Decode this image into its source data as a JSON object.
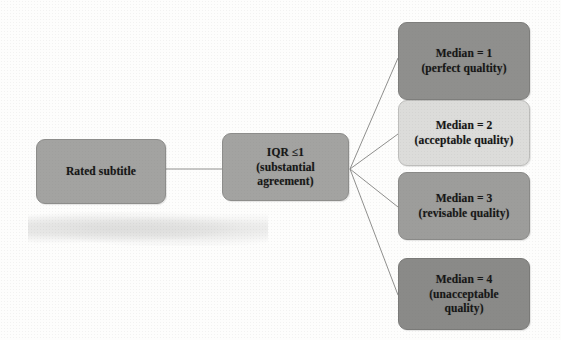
{
  "diagram": {
    "type": "flow-tree",
    "background_color": "#fdfdfc",
    "connector_color": "#8f8f8d",
    "nodes": {
      "rated": {
        "label": "Rated subtitle",
        "lines": [
          "Rated subtitle"
        ],
        "fill": "#a3a3a1",
        "border": "#8d8d8b"
      },
      "iqr": {
        "lines": [
          "IQR ≤1",
          "(substantial",
          "agreement)"
        ],
        "line1": "IQR ≤1",
        "line2": "(substantial",
        "line3": "agreement)",
        "fill": "#a3a3a1",
        "border": "#8d8d8b"
      },
      "median1": {
        "line1": "Median = 1",
        "line2": "(perfect qualtity)",
        "fill": "#8f8f8d",
        "border": "#7e7e7c"
      },
      "median2": {
        "line1": "Median = 2",
        "line2": "(acceptable quality)",
        "fill": "#dcdcda",
        "border": "#bdbdbb"
      },
      "median3": {
        "line1": "Median = 3",
        "line2": "(revisable quality)",
        "fill": "#9d9d9b",
        "border": "#8a8a88"
      },
      "median4": {
        "line1": "Median = 4",
        "line2": "(unacceptable",
        "line3": "quality)",
        "fill": "#8a8a88",
        "border": "#7a7a78"
      }
    },
    "edges": [
      {
        "from": "rated",
        "to": "iqr",
        "style": "straight-horizontal"
      },
      {
        "from": "iqr",
        "to": "median1",
        "style": "straight-diagonal"
      },
      {
        "from": "iqr",
        "to": "median2",
        "style": "straight-diagonal"
      },
      {
        "from": "iqr",
        "to": "median3",
        "style": "straight-diagonal"
      },
      {
        "from": "iqr",
        "to": "median4",
        "style": "straight-diagonal"
      }
    ]
  }
}
